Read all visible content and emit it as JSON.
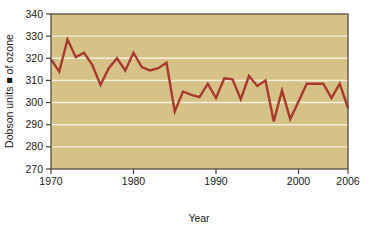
{
  "chart_data": {
    "type": "line",
    "title": "",
    "subtitle": "",
    "xlabel": "Year",
    "ylabel": "Dobson units ■ of ozone",
    "ylabel_raw": "Dobson units of ozone",
    "xlim": [
      1970,
      2006
    ],
    "ylim": [
      270,
      340
    ],
    "xticks": [
      1970,
      1980,
      1990,
      2000,
      2006
    ],
    "xtick_labels": [
      "1970",
      "1980",
      "1990",
      "2000",
      "2006"
    ],
    "yticks": [
      270,
      280,
      290,
      300,
      310,
      320,
      330,
      340
    ],
    "ytick_labels": [
      "270",
      "280",
      "290",
      "300",
      "310",
      "320",
      "330",
      "340"
    ],
    "grid": "horizontal",
    "grid_color": "#f5efdc",
    "legend": "none",
    "plot_background": "#d6c287",
    "line_color": "#a8392f",
    "line_width": 2.4,
    "axis_color": "#4a4036",
    "x": [
      1970,
      1971,
      1972,
      1973,
      1974,
      1975,
      1976,
      1977,
      1978,
      1979,
      1980,
      1981,
      1982,
      1983,
      1984,
      1985,
      1986,
      1987,
      1988,
      1989,
      1990,
      1991,
      1992,
      1993,
      1994,
      1995,
      1996,
      1997,
      1998,
      1999,
      2000,
      2001,
      2002,
      2003,
      2004,
      2005,
      2006
    ],
    "values": [
      319.5,
      314.0,
      328.5,
      320.5,
      322.5,
      317.0,
      308.0,
      315.5,
      320.0,
      314.5,
      322.5,
      316.0,
      314.5,
      315.5,
      318.0,
      296.0,
      305.0,
      303.5,
      302.5,
      308.5,
      302.0,
      311.0,
      310.5,
      301.5,
      312.0,
      307.5,
      310.0,
      291.5,
      305.5,
      292.5,
      300.5,
      308.5,
      308.5,
      308.5,
      302.0,
      308.5,
      297.5
    ],
    "series_name": "Total column ozone",
    "units": "Dobson units"
  },
  "axis_labels": {
    "x_title": "Year",
    "y_title": "Dobson units ■ of ozone"
  }
}
